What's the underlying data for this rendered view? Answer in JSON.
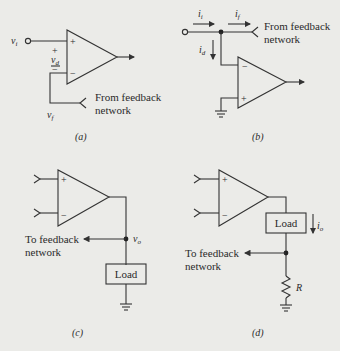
{
  "panels": {
    "a": {
      "caption": "(a)",
      "input_label": "v",
      "input_sub": "i",
      "plus": "+",
      "minus": "−",
      "vd_label": "v",
      "vd_sub": "d",
      "vd_plus": "+",
      "vd_minus": "−",
      "feedback_line1": "From feedback",
      "feedback_line2": "network",
      "vf_label": "v",
      "vf_sub": "f"
    },
    "b": {
      "caption": "(b)",
      "ii_label": "i",
      "ii_sub": "i",
      "if_label": "i",
      "if_sub": "f",
      "id_label": "i",
      "id_sub": "d",
      "plus": "+",
      "minus": "−",
      "feedback_line1": "From feedback",
      "feedback_line2": "network"
    },
    "c": {
      "caption": "(c)",
      "plus": "+",
      "minus": "−",
      "feedback_line1": "To feedback",
      "feedback_line2": "network",
      "vo_label": "v",
      "vo_sub": "o",
      "load_label": "Load"
    },
    "d": {
      "caption": "(d)",
      "plus": "+",
      "minus": "−",
      "feedback_line1": "To feedback",
      "feedback_line2": "network",
      "io_label": "i",
      "io_sub": "o",
      "load_label": "Load",
      "resistor_label": "R"
    }
  },
  "colors": {
    "background": "#ebebe8",
    "ink": "#333333"
  }
}
